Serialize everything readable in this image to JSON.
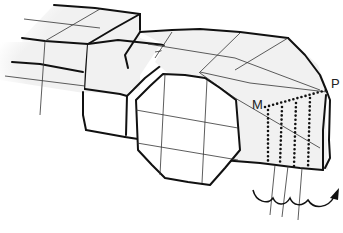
{
  "diagram": {
    "labels": {
      "point_m": "M",
      "point_p": "P"
    },
    "colors": {
      "face_fill": "#f1f1f1",
      "outline": "#111111",
      "grid": "#333333",
      "background": "#ffffff"
    },
    "elements": {
      "left_block": "rectangular prism on the left with grid lines",
      "middle_block": "narrower connecting block",
      "octagon_face": "octagonal cross-section end face with 3x3 grid",
      "right_block": "angled upper block with diagonal grid lines ending at point P",
      "dotted_triangle": "dotted line from M to P and 4 vertical dotted lines below",
      "rotation_arrow": "wavy curled arrow pointing right indicating rotation"
    }
  }
}
